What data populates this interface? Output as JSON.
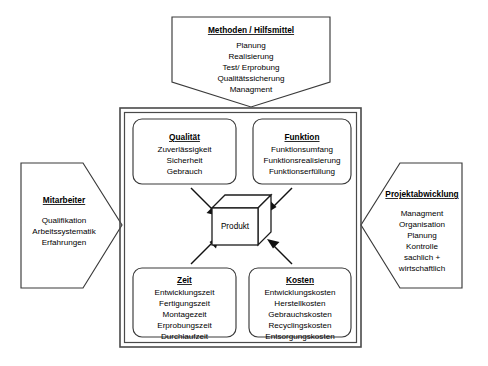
{
  "diagram": {
    "title_hidden": "Produktentstehung - Einflussfaktoren",
    "center": {
      "label": "Produkt",
      "shape": "cube-3d"
    },
    "outer_nodes": [
      {
        "id": "methoden",
        "position": "top",
        "shape": "pentagon-down",
        "title": "Methoden / Hilfsmittel",
        "items": [
          "Planung",
          "Realisierung",
          "Test/ Erprobung",
          "Qualitätssicherung",
          "Managment"
        ]
      },
      {
        "id": "mitarbeiter",
        "position": "left",
        "shape": "pentagon-right",
        "title": "Mitarbeiter",
        "items": [
          "Qualifikation",
          "Arbeitssystematik",
          "Erfahrungen"
        ]
      },
      {
        "id": "projektabwicklung",
        "position": "right",
        "shape": "pentagon-left",
        "title": "Projektabwicklung",
        "items": [
          "Managment",
          "Organisation",
          "Planung",
          "Kontrolle",
          "sachlich +",
          "wirtschaftlich"
        ]
      }
    ],
    "inner_nodes": [
      {
        "id": "qualitaet",
        "position": "top-left",
        "shape": "rounded-rect",
        "title": "Qualität",
        "items": [
          "Zuverlässigkeit",
          "Sicherheit",
          "Gebrauch"
        ]
      },
      {
        "id": "funktion",
        "position": "top-right",
        "shape": "rounded-rect",
        "title": "Funktion",
        "items": [
          "Funktionsumfang",
          "Funktionsrealisierung",
          "Funktionserfüllung"
        ]
      },
      {
        "id": "zeit",
        "position": "bottom-left",
        "shape": "rounded-rect",
        "title": "Zeit",
        "items": [
          "Entwicklungszeit",
          "Fertigungszeit",
          "Montagezeit",
          "Erprobungszeit",
          "Durchlaufzeit"
        ]
      },
      {
        "id": "kosten",
        "position": "bottom-right",
        "shape": "rounded-rect",
        "title": "Kosten",
        "items": [
          "Entwicklungskosten",
          "Herstellkosten",
          "Gebrauchskosten",
          "Recyclingskosten",
          "Entsorgungskosten"
        ]
      }
    ],
    "arrows": [
      {
        "id": "qualitaet-to-produkt",
        "from": "qualitaet",
        "to": "produkt",
        "direction": "down-right"
      },
      {
        "id": "funktion-to-produkt",
        "from": "funktion",
        "to": "produkt",
        "direction": "down-left"
      },
      {
        "id": "zeit-to-produkt",
        "from": "zeit",
        "to": "produkt",
        "direction": "up-right"
      },
      {
        "id": "kosten-to-produkt",
        "from": "kosten",
        "to": "produkt",
        "direction": "up-left"
      }
    ],
    "colors": {
      "background": "#ffffff",
      "stroke": "#3a3a3a",
      "frame_stroke": "#4a4a4a",
      "text": "#000000",
      "arrow": "#111111"
    }
  }
}
